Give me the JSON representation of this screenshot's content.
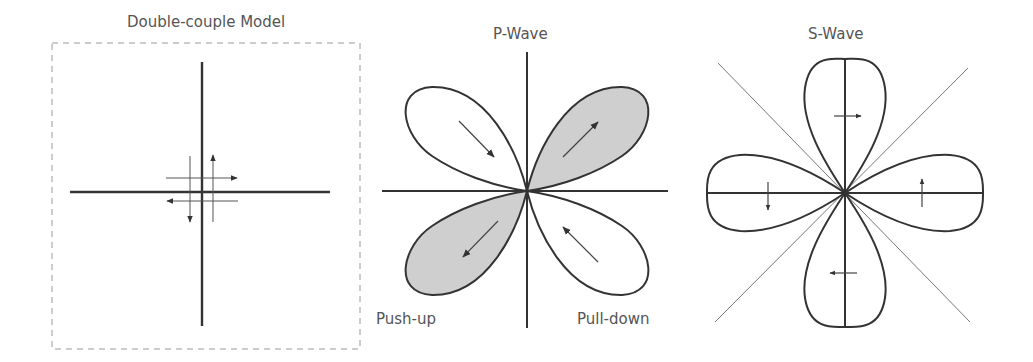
{
  "panels": [
    {
      "id": "double-couple",
      "title": "Double-couple Model"
    },
    {
      "id": "p-wave",
      "title": "P-Wave",
      "labels": {
        "left_bottom": "Push-up",
        "right_bottom": "Pull-down"
      }
    },
    {
      "id": "s-wave",
      "title": "S-Wave"
    }
  ],
  "colors": {
    "line": "#333333",
    "shaded_lobe": "#cfcfcf",
    "text": "#555555",
    "dashed_border": "#9a9a9a",
    "nodal_line": "#777777"
  }
}
